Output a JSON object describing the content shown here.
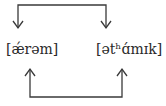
{
  "diagram": {
    "words": [
      {
        "id": "left",
        "text": "[ǽrəm]"
      },
      {
        "id": "right",
        "text": "[ətʰɑ́mɪk]"
      }
    ],
    "connectors": [
      {
        "id": "top",
        "from": "left",
        "to": "right",
        "direction": "down",
        "description": "top bracket with downward arrows onto both words"
      },
      {
        "id": "bottom",
        "from": "left",
        "to": "right",
        "direction": "up",
        "description": "bottom bracket with upward arrows onto both words"
      }
    ],
    "colors": {
      "line": "#3a3a3a",
      "text": "#2a2a2a"
    }
  }
}
